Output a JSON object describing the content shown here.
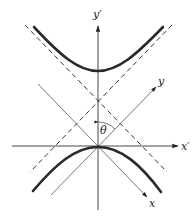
{
  "diagram": {
    "type": "rotated-axes-hyperbola",
    "labels": {
      "y_prime": "y′",
      "x_prime": "x′",
      "y_rot": "y",
      "x_rot": "x",
      "angle": "θ"
    },
    "colors": {
      "curve": "#2a2a2a",
      "axis": "#333333",
      "background": "#ffffff"
    }
  }
}
